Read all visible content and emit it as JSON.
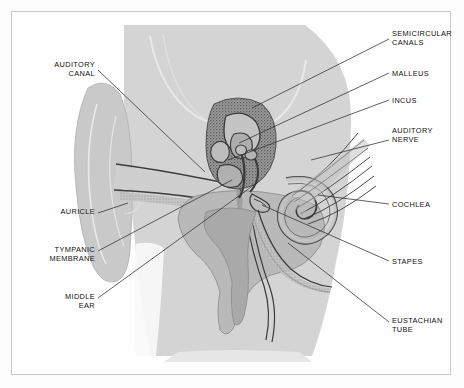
{
  "diagram": {
    "type": "labeled-anatomical-cross-section",
    "colors": {
      "page_background": "#fdfdfd",
      "frame_border": "#c9c9c9",
      "head_fill": "#d4d4d4",
      "auricle_fill": "#c9c9c9",
      "bone_fill": "#b5b5b5",
      "bone_dark": "#8d8d8d",
      "outline": "#3a3a3a",
      "label_text": "#121212",
      "leader_line": "#2e2e2e",
      "highlight": "#e8e8e8"
    },
    "labels": [
      {
        "id": "auditory-canal",
        "text": "AUDITORY\nCANAL",
        "side": "left",
        "x": 95,
        "y": 60,
        "leader": [
          [
            98,
            70
          ],
          [
            205,
            172
          ]
        ]
      },
      {
        "id": "auricle",
        "text": "AURICLE",
        "side": "left",
        "x": 95,
        "y": 210,
        "leader": [
          [
            98,
            213
          ],
          [
            128,
            203
          ]
        ]
      },
      {
        "id": "tympanic-membrane",
        "text": "TYMPANIC\nMEMBRANE",
        "side": "left",
        "x": 95,
        "y": 248,
        "leader": [
          [
            98,
            251
          ],
          [
            232,
            180
          ]
        ]
      },
      {
        "id": "middle-ear",
        "text": "MIDDLE\nEAR",
        "side": "left",
        "x": 95,
        "y": 295,
        "leader": [
          [
            98,
            298
          ],
          [
            258,
            182
          ]
        ]
      },
      {
        "id": "semicircular-canals",
        "text": "SEMICIRCULAR\nCANALS",
        "side": "right",
        "x": 392,
        "y": 33,
        "leader": [
          [
            389,
            39
          ],
          [
            252,
            108
          ]
        ]
      },
      {
        "id": "malleus",
        "text": "MALLEUS",
        "side": "right",
        "x": 392,
        "y": 70,
        "leader": [
          [
            389,
            73
          ],
          [
            239,
            143
          ]
        ]
      },
      {
        "id": "incus",
        "text": "INCUS",
        "side": "right",
        "x": 392,
        "y": 97,
        "leader": [
          [
            389,
            100
          ],
          [
            228,
            160
          ]
        ]
      },
      {
        "id": "auditory-nerve",
        "text": "AUDITORY\nNERVE",
        "side": "right",
        "x": 392,
        "y": 128,
        "leader": [
          [
            389,
            140
          ],
          [
            311,
            160
          ]
        ]
      },
      {
        "id": "cochlea",
        "text": "COCHLEA",
        "side": "right",
        "x": 392,
        "y": 201,
        "leader": [
          [
            389,
            204
          ],
          [
            318,
            195
          ]
        ]
      },
      {
        "id": "stapes",
        "text": "STAPES",
        "side": "right",
        "x": 392,
        "y": 258,
        "leader": [
          [
            389,
            261
          ],
          [
            262,
            205
          ]
        ]
      },
      {
        "id": "eustachian-tube",
        "text": "EUSTACHIAN\nTUBE",
        "side": "right",
        "x": 392,
        "y": 319,
        "leader": [
          [
            389,
            322
          ],
          [
            288,
            243
          ]
        ]
      }
    ]
  }
}
